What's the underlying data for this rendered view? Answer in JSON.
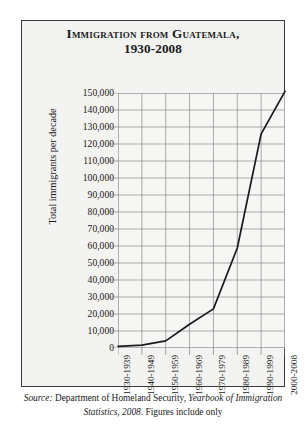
{
  "figure": {
    "title": "Immigration from Guatemala,",
    "subtitle": "1930-2008",
    "source_label": "Source:",
    "source_text_1": "Department of Homeland Security,",
    "source_italic": "Yearbook of Immigration Statistics, 2008",
    "source_text_2": ". Figures include only",
    "line_color": "#1a1a1a",
    "grid_color": "#8a8a8a",
    "panel_background": "#f3f3f1",
    "border_color": "#3a3a3a"
  },
  "chart_data": {
    "type": "line",
    "title": "Immigration from Guatemala, 1930-2008",
    "xlabel": "",
    "ylabel": "Total immigrants per decade",
    "categories": [
      "1930-1939",
      "1940-1949",
      "1950-1959",
      "1960-1969",
      "1970-1979",
      "1980-1989",
      "1990-1999",
      "2000-2008"
    ],
    "values": [
      1000,
      1700,
      4200,
      14000,
      23000,
      58800,
      126000,
      151000
    ],
    "ylim": [
      0,
      150000
    ],
    "ytick_labels": [
      "150,000",
      "140,000",
      "130,000",
      "120,000",
      "110,000",
      "100,000",
      "90,000",
      "80,000",
      "70,000",
      "60,000",
      "50,000",
      "40,000",
      "30,000",
      "20,000",
      "10,000",
      "0"
    ],
    "ytick_values": [
      150000,
      140000,
      130000,
      120000,
      110000,
      100000,
      90000,
      80000,
      70000,
      60000,
      50000,
      40000,
      30000,
      20000,
      10000,
      0
    ],
    "grid": true,
    "legend": "none"
  }
}
